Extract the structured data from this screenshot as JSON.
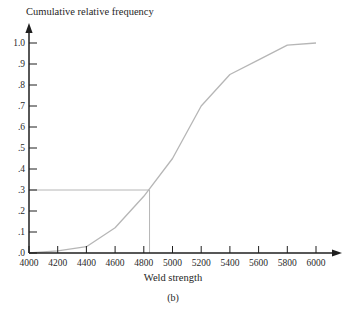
{
  "caption": "(b)",
  "chart_data": {
    "type": "line",
    "title": "Cumulative relative frequency",
    "xlabel": "Weld strength",
    "ylabel": "",
    "x": [
      4000,
      4200,
      4400,
      4600,
      4800,
      5000,
      5200,
      5400,
      5600,
      5800,
      6000
    ],
    "y": [
      0,
      0.01,
      0.03,
      0.12,
      0.27,
      0.45,
      0.7,
      0.85,
      0.92,
      0.99,
      1.0
    ],
    "x_tick_labels": [
      "4000",
      "4200",
      "4400",
      "4600",
      "4800",
      "5000",
      "5200",
      "5400",
      "5600",
      "5800",
      "6000"
    ],
    "y_ticks": [
      {
        "value": 0,
        "label": ".0"
      },
      {
        "value": 0.1,
        "label": ".1"
      },
      {
        "value": 0.2,
        "label": ".2"
      },
      {
        "value": 0.3,
        "label": ".3"
      },
      {
        "value": 0.4,
        "label": ".4"
      },
      {
        "value": 0.5,
        "label": ".5"
      },
      {
        "value": 0.6,
        "label": ".6"
      },
      {
        "value": 0.7,
        "label": ".7"
      },
      {
        "value": 0.8,
        "label": ".8"
      },
      {
        "value": 0.9,
        "label": ".9"
      },
      {
        "value": 1,
        "label": "1.0"
      }
    ],
    "xlim": [
      4000,
      6000
    ],
    "ylim": [
      0,
      1.0
    ],
    "grid": false,
    "legend": false,
    "reference": {
      "frequency": 0.3,
      "weld_strength": 4840
    },
    "curve_color": "#b6b6b6",
    "axis_color": "#1f1f1f",
    "text_color": "#2a2a2a"
  }
}
